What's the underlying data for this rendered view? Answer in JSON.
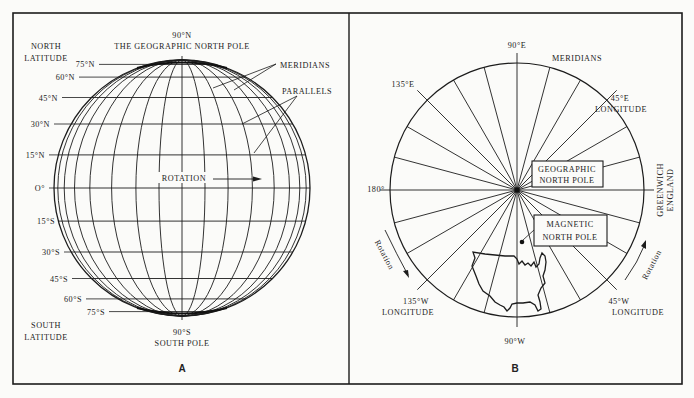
{
  "figure": {
    "panels": [
      {
        "id": "A",
        "label": "A",
        "title_top": "90°N",
        "title_top_sub": "THE GEOGRAPHIC NORTH POLE",
        "bottom_pole": "90°S",
        "bottom_pole_sub": "SOUTH POLE",
        "north_label_1": "NORTH",
        "north_label_2": "LATITUDE",
        "south_label_1": "SOUTH",
        "south_label_2": "LATITUDE",
        "meridians_label": "MERIDIANS",
        "parallels_label": "PARALLELS",
        "rotation_label": "ROTATION",
        "parallels": [
          "75°N",
          "60°N",
          "45°N",
          "30°N",
          "15°N",
          "O°",
          "15°S",
          "30°S",
          "45°S",
          "60°S",
          "75°S"
        ]
      },
      {
        "id": "B",
        "label": "B",
        "top_label": "90°E",
        "meridians_label": "MERIDIANS",
        "label_135e": "135°E",
        "label_45e": "45°E",
        "label_45e_sub": "LONGITUDE",
        "label_180": "180°",
        "greenwich_1": "GREENWICH",
        "greenwich_2": "ENGLAND",
        "geo_pole_1": "GEOGRAPHIC",
        "geo_pole_2": "NORTH POLE",
        "mag_pole_1": "MAGNETIC",
        "mag_pole_2": "NORTH POLE",
        "label_135w": "135°W",
        "label_135w_sub": "LONGITUDE",
        "label_45w": "45°W",
        "label_45w_sub": "LONGITUDE",
        "label_90w": "90°W",
        "rotation_left": "Rotation",
        "rotation_right": "Rotation"
      }
    ]
  }
}
